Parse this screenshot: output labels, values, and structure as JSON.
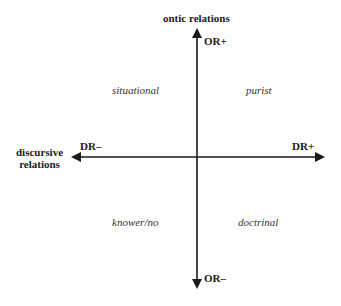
{
  "axes": {
    "vertical": {
      "title": "ontic relations",
      "positive_label": "OR+",
      "negative_label": "OR–"
    },
    "horizontal": {
      "title_line1": "discursive",
      "title_line2": "relations",
      "positive_label": "DR+",
      "negative_label": "DR–"
    }
  },
  "quadrants": {
    "top_left": "situational",
    "top_right": "purist",
    "bottom_left": "knower/no",
    "bottom_right": "doctrinal"
  },
  "colors": {
    "axis": "#1a1a1a",
    "background": "#ffffff"
  }
}
